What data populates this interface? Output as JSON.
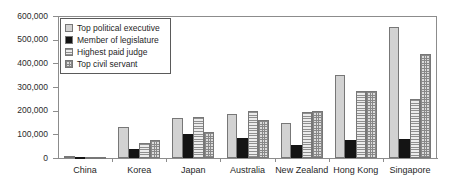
{
  "chart_data": {
    "type": "bar",
    "title": "",
    "xlabel": "",
    "ylabel": "",
    "ylim": [
      0,
      600000
    ],
    "ytick_labels": [
      "600,000",
      "500,000",
      "400,000",
      "300,000",
      "200,000",
      "100,000",
      "0"
    ],
    "ytick_values": [
      600000,
      500000,
      400000,
      300000,
      200000,
      100000,
      0
    ],
    "grid": false,
    "legend_position": "upper-left-inside",
    "categories": [
      "China",
      "Korea",
      "Japan",
      "Australia",
      "New Zealand",
      "Hong Kong",
      "Singapore"
    ],
    "series": [
      {
        "name": "Top political executive",
        "swatch": "light-plain",
        "color": "#d2d2d2",
        "values": [
          10000,
          131000,
          170000,
          186000,
          148000,
          350000,
          555000
        ]
      },
      {
        "name": "Member of legislature",
        "swatch": "solid-black",
        "color": "#141414",
        "values": [
          3000,
          40000,
          100000,
          85000,
          55000,
          75000,
          80000
        ]
      },
      {
        "name": "Highest paid judge",
        "swatch": "horizontal-lines",
        "color": "#e2e2e2",
        "values": [
          2000,
          62000,
          175000,
          200000,
          195000,
          285000,
          250000
        ]
      },
      {
        "name": "Top civil servant",
        "swatch": "crosshatch-grid",
        "color": "#dcdcdc",
        "values": [
          4000,
          78000,
          110000,
          160000,
          198000,
          282000,
          440000
        ]
      }
    ]
  }
}
